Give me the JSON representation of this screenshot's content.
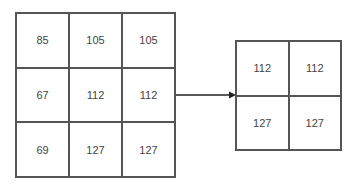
{
  "input_matrix": {
    "rows": [
      [
        "85",
        "105",
        "105"
      ],
      [
        "67",
        "112",
        "112"
      ],
      [
        "69",
        "127",
        "127"
      ]
    ]
  },
  "output_matrix": {
    "rows": [
      [
        "112",
        "112"
      ],
      [
        "127",
        "127"
      ]
    ]
  },
  "arrow": {
    "color": "#222222"
  }
}
